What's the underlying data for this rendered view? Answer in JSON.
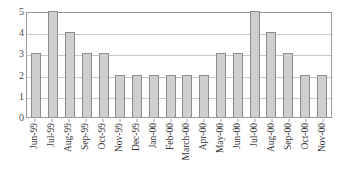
{
  "chart_data": {
    "type": "bar",
    "title": "",
    "subtitle": "",
    "xlabel": "",
    "ylabel": "",
    "ylim": [
      0,
      5
    ],
    "yticks": [
      0,
      1,
      2,
      3,
      4,
      5
    ],
    "grid": true,
    "legend": false,
    "legend_position": "none",
    "categories": [
      "Jun-99",
      "Jul-99",
      "Aug-99",
      "Sep-99",
      "Oct-99",
      "Nov-99",
      "Dec-99",
      "Jan-00",
      "Feb-00",
      "March-00",
      "Apr-00",
      "May-00",
      "Jun-00",
      "Jul-00",
      "Aug-00",
      "Sep-00",
      "Oct-00",
      "Nov-00"
    ],
    "values": [
      3,
      5,
      4,
      3,
      3,
      2,
      2,
      2,
      2,
      2,
      2,
      3,
      3,
      5,
      4,
      3,
      2,
      2
    ],
    "bar_fill_color": "#cfcfcf",
    "bar_border_color": "#8c8c8c",
    "gridline_color": "#c9c9c9",
    "axis_color": "#9a9a9a",
    "background_color": "#ffffff"
  }
}
